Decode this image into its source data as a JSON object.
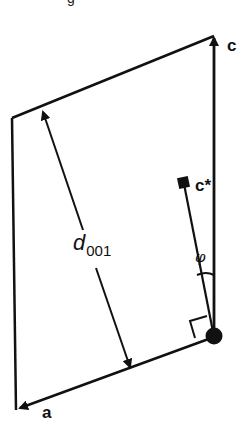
{
  "figure": {
    "type": "crystal-lattice-geometry",
    "cutoff_text": "g",
    "labels": {
      "c_axis": "c",
      "c_star": "c*",
      "a_axis": "a",
      "d_spacing_main": "d",
      "d_spacing_sub": "001",
      "angle": "φ"
    },
    "colors": {
      "stroke": "#111111",
      "background": "#ffffff"
    }
  }
}
